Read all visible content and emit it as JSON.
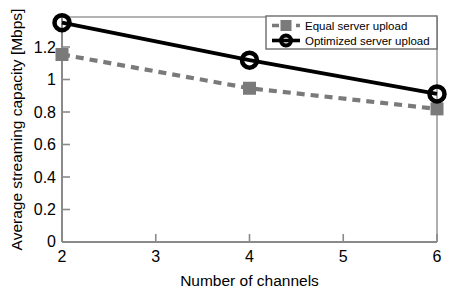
{
  "chart_data": {
    "type": "line",
    "title": "",
    "subtitle": "",
    "xlabel": "Number of channels",
    "ylabel": "Average streaming capacity [Mbps]",
    "x": [
      2,
      4,
      6
    ],
    "xlim": [
      2,
      6
    ],
    "ylim": [
      0,
      1.2
    ],
    "xticks": [
      "2",
      "3",
      "4",
      "5",
      "6"
    ],
    "xtick_values": [
      2,
      3,
      4,
      5,
      6
    ],
    "yticks": [
      "0",
      "0.2",
      "0.4",
      "0.6",
      "0.8",
      "1",
      "1.2"
    ],
    "ytick_values": [
      0,
      0.2,
      0.4,
      0.6,
      0.8,
      1.0,
      1.2
    ],
    "grid": false,
    "legend_position": "top-right",
    "series": [
      {
        "name": "Equal server upload",
        "values": [
          1.0,
          0.82,
          0.71
        ],
        "color": "#7a7a7a",
        "linestyle": "dashed",
        "marker": "square"
      },
      {
        "name": "Optimized server upload",
        "values": [
          1.17,
          0.97,
          0.79
        ],
        "color": "#000000",
        "linestyle": "solid",
        "marker": "circle"
      }
    ]
  },
  "legend": {
    "entries": [
      {
        "label": "Equal server upload",
        "marker": "legend-square-marker"
      },
      {
        "label": "Optimized server upload",
        "marker": "legend-circle-marker"
      }
    ]
  },
  "colors": {
    "equal_series": "#7a7a7a",
    "optimized_series": "#000000",
    "axis": "#808080",
    "background": "#ffffff"
  }
}
